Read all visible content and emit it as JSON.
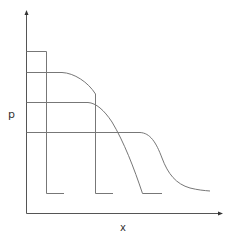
{
  "diagram": {
    "axes": {
      "y_label": "p",
      "x_label": "x"
    },
    "curves": [
      {
        "name": "level-1",
        "plateau_y": 51,
        "shape": "rectangular step"
      },
      {
        "name": "level-2",
        "plateau_y": 72,
        "shape": "rounded drop then vertical"
      },
      {
        "name": "level-3",
        "plateau_y": 102,
        "shape": "rounded drop"
      },
      {
        "name": "level-4",
        "plateau_y": 132,
        "shape": "sigmoid tail"
      }
    ],
    "colors": {
      "line": "#666666",
      "axis": "#555555",
      "background": "#ffffff"
    }
  }
}
